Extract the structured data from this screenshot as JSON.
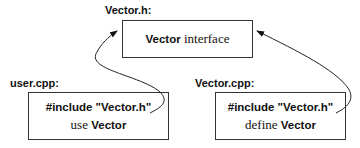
{
  "diagram": {
    "header_file": {
      "label": "Vector.h:",
      "content": {
        "keyword": "Vector",
        "text": " interface"
      }
    },
    "user_file": {
      "label": "user.cpp:",
      "line1": "#include \"Vector.h\"",
      "line2": {
        "text": "use ",
        "keyword": "Vector"
      }
    },
    "impl_file": {
      "label": "Vector.cpp:",
      "line1": "#include \"Vector.h\"",
      "line2": {
        "text": "define ",
        "keyword": "Vector"
      }
    },
    "edges": [
      {
        "from": "user.cpp",
        "to": "Vector.h",
        "type": "include-arrow"
      },
      {
        "from": "Vector.cpp",
        "to": "Vector.h",
        "type": "include-arrow"
      }
    ]
  }
}
